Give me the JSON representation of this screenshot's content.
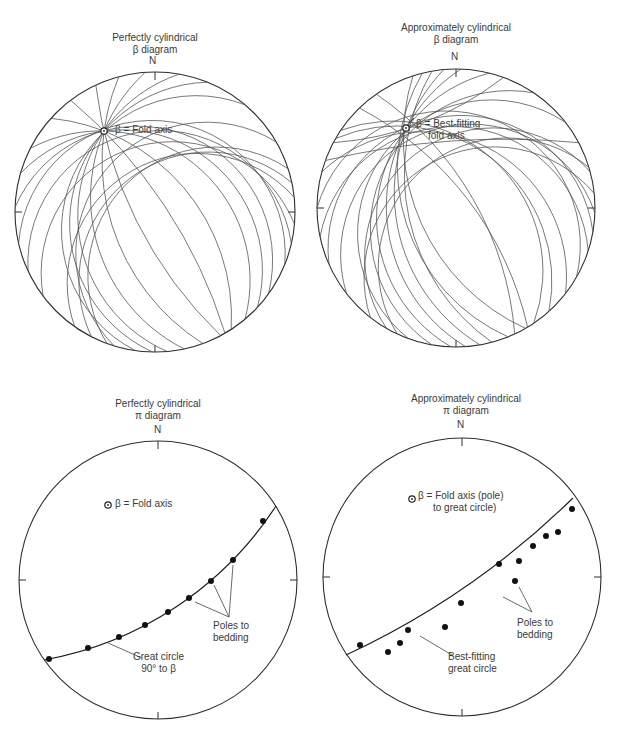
{
  "figure": {
    "panels": [
      {
        "id": "beta_perfect",
        "title_line1": "Perfectly cylindrical",
        "title_line2": "β diagram",
        "north_label": "N",
        "center": [
          155,
          212
        ],
        "radius": 140,
        "fold_axis": [
          104,
          131
        ],
        "annotation": "β = Fold axis",
        "great_circle_endpoints_deg": [
          [
            95,
            270
          ],
          [
            110,
            255
          ],
          [
            122,
            240
          ],
          [
            135,
            224
          ],
          [
            152,
            210
          ],
          [
            165,
            196
          ],
          [
            178,
            182
          ],
          [
            196,
            168
          ],
          [
            208,
            155
          ],
          [
            222,
            140
          ],
          [
            237,
            128
          ],
          [
            252,
            113
          ],
          [
            266,
            103
          ],
          [
            280,
            92
          ],
          [
            298,
            78
          ],
          [
            318,
            62
          ],
          [
            338,
            44
          ],
          [
            20,
            12
          ]
        ]
      },
      {
        "id": "beta_approx",
        "title_line1": "Approximately cylindrical",
        "title_line2": "β diagram",
        "north_label": "N",
        "center": [
          456,
          208
        ],
        "radius": 139,
        "fold_axis": [
          406,
          128
        ],
        "annotation_line1": "β = Best-fitting",
        "annotation_line2": "fold axis"
      },
      {
        "id": "pi_perfect",
        "title_line1": "Perfectly cylindrical",
        "title_line2": "π diagram",
        "north_label": "N",
        "center": [
          158,
          580
        ],
        "radius": 139,
        "fold_axis": [
          108,
          505
        ],
        "annotation": "β = Fold axis",
        "great_circle_label_line1": "Great circle",
        "great_circle_label_line2": "90° to β",
        "poles_label_line1": "Poles to",
        "poles_label_line2": "bedding",
        "poles": [
          [
            49,
            659
          ],
          [
            88,
            648
          ],
          [
            119,
            637
          ],
          [
            145,
            625
          ],
          [
            168,
            612
          ],
          [
            189,
            598
          ],
          [
            211,
            581
          ],
          [
            233,
            560
          ],
          [
            263,
            521
          ]
        ]
      },
      {
        "id": "pi_approx",
        "title_line1": "Approximately cylindrical",
        "title_line2": "π diagram",
        "north_label": "N",
        "center": [
          462,
          577
        ],
        "radius": 139,
        "fold_axis": [
          412,
          499
        ],
        "annotation_line1": "β = Fold axis (pole)",
        "annotation_line2": "to great circle)",
        "great_circle_label_line1": "Best-fitting",
        "great_circle_label_line2": "great circle",
        "poles_label_line1": "Poles to",
        "poles_label_line2": "bedding",
        "poles": [
          [
            360,
            645
          ],
          [
            388,
            652
          ],
          [
            400,
            643
          ],
          [
            408,
            630
          ],
          [
            445,
            627
          ],
          [
            461,
            603
          ],
          [
            499,
            564
          ],
          [
            515,
            581
          ],
          [
            519,
            561
          ],
          [
            533,
            546
          ],
          [
            546,
            536
          ],
          [
            558,
            532
          ],
          [
            572,
            509
          ]
        ]
      }
    ]
  }
}
